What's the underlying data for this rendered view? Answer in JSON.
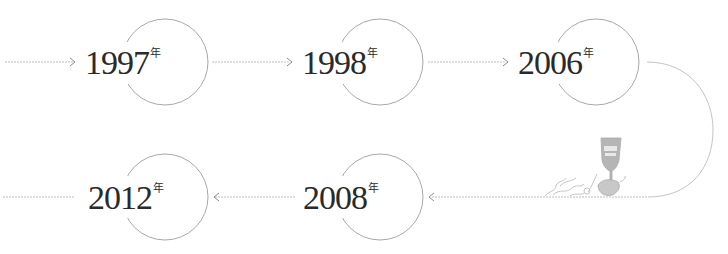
{
  "timeline": {
    "items": [
      {
        "year": "1997",
        "suffix": "年"
      },
      {
        "year": "1998",
        "suffix": "年"
      },
      {
        "year": "2006",
        "suffix": "年"
      },
      {
        "year": "2008",
        "suffix": "年"
      },
      {
        "year": "2012",
        "suffix": "年"
      }
    ],
    "decoration": "wine-glass-with-vine-illustration",
    "line_color": "#b8b8b8",
    "circle_color": "#a0a0a0",
    "text_color": "#2a2a2a"
  }
}
